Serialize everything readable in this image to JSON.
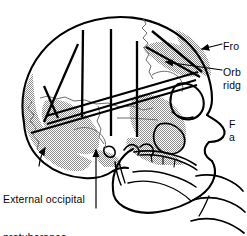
{
  "figure": {
    "background_color": "#ffffff",
    "ink_color": "#000000",
    "shading_color": "#a9a9a9",
    "suture_color": "#7a7a7a"
  },
  "labels": {
    "external_occipital": {
      "line1": "External occipital",
      "line2": "protuberance"
    },
    "petrous_ridge": {
      "line1": "Petrous ridge"
    },
    "frontal": {
      "line1": "Fro"
    },
    "orbital": {
      "line1": "Orb",
      "line2": "ridg"
    },
    "facial": {
      "line1": "F",
      "line2": "a"
    }
  },
  "annotations": {
    "leader_lines": [
      "external-occipital-leader",
      "petrous-ridge-leader",
      "frontal-leader",
      "orbital-leader"
    ],
    "positioning_lines_count": 9,
    "arrowheads_count": 3
  }
}
